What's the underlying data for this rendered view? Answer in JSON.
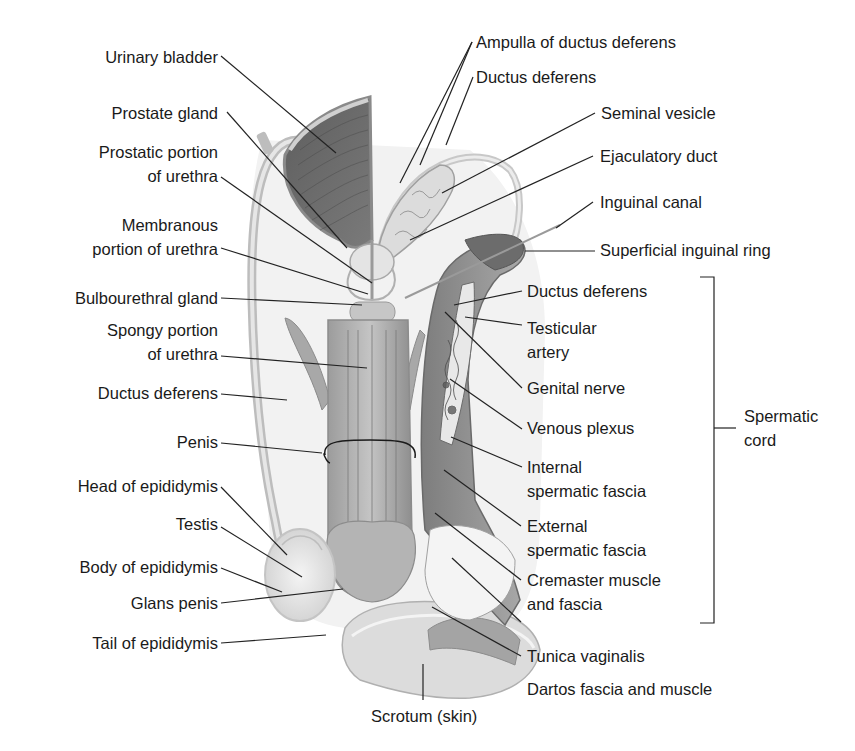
{
  "figure": {
    "type": "labeled anatomical illustration"
  },
  "labels": {
    "urinary_bladder": "Urinary bladder",
    "prostate_gland": "Prostate gland",
    "prostatic_urethra": "Prostatic portion\nof urethra",
    "membranous_urethra": "Membranous\nportion of urethra",
    "bulbourethral_gland": "Bulbourethral gland",
    "spongy_urethra": "Spongy portion\nof urethra",
    "ductus_deferens_left": "Ductus deferens",
    "penis": "Penis",
    "head_epididymis": "Head of epididymis",
    "testis": "Testis",
    "body_epididymis": "Body of epididymis",
    "glans_penis": "Glans penis",
    "tail_epididymis": "Tail of epididymis",
    "scrotum": "Scrotum (skin)",
    "ampulla": "Ampulla of ductus deferens",
    "ductus_deferens_top": "Ductus deferens",
    "seminal_vesicle": "Seminal vesicle",
    "ejaculatory_duct": "Ejaculatory duct",
    "inguinal_canal": "Inguinal canal",
    "superficial_ring": "Superficial inguinal ring",
    "ductus_deferens_cord": "Ductus deferens",
    "testicular_artery": "Testicular\nartery",
    "genital_nerve": "Genital nerve",
    "venous_plexus": "Venous plexus",
    "internal_fascia": "Internal\nspermatic fascia",
    "external_fascia": "External\nspermatic fascia",
    "cremaster": "Cremaster muscle\nand fascia",
    "tunica_vaginalis": "Tunica vaginalis",
    "dartos": "Dartos fascia and muscle",
    "spermatic_cord": "Spermatic\ncord"
  },
  "colors": {
    "background": "#ffffff",
    "text": "#1a1a1a",
    "leader_line": "#222222",
    "muscle_dark": "#6e6e6e",
    "tissue_mid": "#a8a8a8",
    "tissue_light": "#d6d6d6",
    "tissue_pale": "#ececec"
  }
}
